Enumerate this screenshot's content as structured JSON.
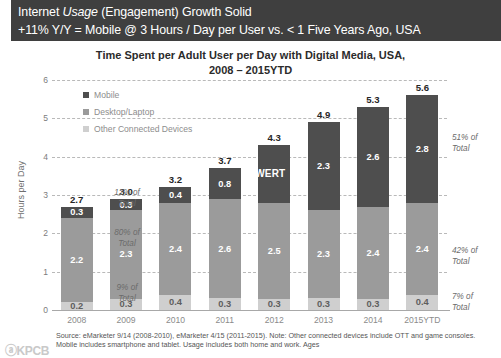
{
  "header": {
    "line1_pre": "Internet ",
    "line1_italic": "Usage",
    "line1_post": " (Engagement) Growth Solid",
    "line2": "+11% Y/Y = Mobile @ 3 Hours / Day per User vs. < 1 Five Years Ago, USA",
    "background_color": "#3f3f3f",
    "text_color": "#ffffff"
  },
  "chart_data": {
    "type": "bar",
    "stacked": true,
    "title_line1": "Time Spent per Adult User per Day with Digital Media, USA,",
    "title_line2": "2008 – 2015YTD",
    "xlabel": "",
    "ylabel": "Hours per Day",
    "ylim": [
      0,
      6
    ],
    "yticks": [
      "0",
      "1",
      "2",
      "3",
      "4",
      "5",
      "6"
    ],
    "grid": true,
    "legend_position": "inside-top-left",
    "categories": [
      "2008",
      "2009",
      "2010",
      "2011",
      "2012",
      "2013",
      "2014",
      "2015YTD"
    ],
    "series": [
      {
        "name": "Mobile",
        "color": "#4e4e4e",
        "values": [
          0.3,
          0.3,
          0.4,
          0.8,
          1.5,
          2.3,
          2.6,
          2.8
        ],
        "labels": [
          "0.3",
          "0.3",
          "0.4",
          "0.8",
          "WERT",
          "2.3",
          "2.6",
          "2.8"
        ]
      },
      {
        "name": "Desktop/Laptop",
        "color": "#9b9b9b",
        "values": [
          2.2,
          2.3,
          2.4,
          2.6,
          2.5,
          2.3,
          2.4,
          2.4
        ],
        "labels": [
          "2.2",
          "2.3",
          "2.4",
          "2.6",
          "2.5",
          "2.3",
          "2.4",
          "2.4"
        ]
      },
      {
        "name": "Other Connected Devices",
        "color": "#cfcfcf",
        "values": [
          0.2,
          0.3,
          0.4,
          0.3,
          0.3,
          0.3,
          0.3,
          0.4
        ],
        "labels": [
          "0.2",
          "0.3",
          "0.4",
          "0.3",
          "0.3",
          "0.3",
          "0.3",
          "0.4"
        ]
      }
    ],
    "totals": [
      "2.7",
      "3.0",
      "3.2",
      "3.7",
      "4.3",
      "4.9",
      "5.3",
      "5.6"
    ],
    "annotations_left": [
      "12% of Total",
      "80% of Total",
      "9% of Total"
    ],
    "annotations_right": [
      "51% of Total",
      "42% of Total",
      "7% of Total"
    ],
    "overlay_text": "WERT"
  },
  "footer": {
    "source": "Source: eMarketer 9/14 (2008-2010), eMarketer 4/15 (2011-2015). Note: Other connected devices include OTT and game consoles. Mobile includes smartphone and tablet. Usage includes both home and work. Ages",
    "logo": "ⓐKPCB"
  }
}
